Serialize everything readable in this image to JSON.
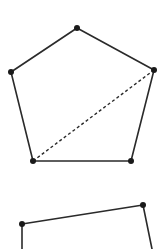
{
  "diagram": {
    "width": 167,
    "height": 249,
    "background": "#ffffff",
    "stroke_color": "#2a2a2a",
    "vertex_color": "#1a1a1a",
    "shapes": [
      {
        "name": "pentagon",
        "type": "polygon",
        "closed": true,
        "vertices": [
          {
            "label": "top",
            "x": 77,
            "y": 28
          },
          {
            "label": "right",
            "x": 154,
            "y": 70
          },
          {
            "label": "bottom-right",
            "x": 131,
            "y": 161
          },
          {
            "label": "bottom-left",
            "x": 33,
            "y": 161
          },
          {
            "label": "left",
            "x": 11,
            "y": 72
          }
        ],
        "diagonals": [
          {
            "from": "bottom-left",
            "to": "right",
            "style": "dashed",
            "x1": 33,
            "y1": 161,
            "x2": 154,
            "y2": 70
          }
        ]
      },
      {
        "name": "partial-polygon",
        "type": "polyline",
        "closed": false,
        "clipped_by_frame": true,
        "vertices": [
          {
            "label": "left",
            "x": 22,
            "y": 224
          },
          {
            "label": "right",
            "x": 143,
            "y": 205
          }
        ],
        "edges": [
          {
            "x1": 22,
            "y1": 224,
            "x2": 22,
            "y2": 249
          },
          {
            "x1": 22,
            "y1": 224,
            "x2": 143,
            "y2": 205
          },
          {
            "x1": 143,
            "y1": 205,
            "x2": 152,
            "y2": 249
          }
        ]
      }
    ]
  }
}
